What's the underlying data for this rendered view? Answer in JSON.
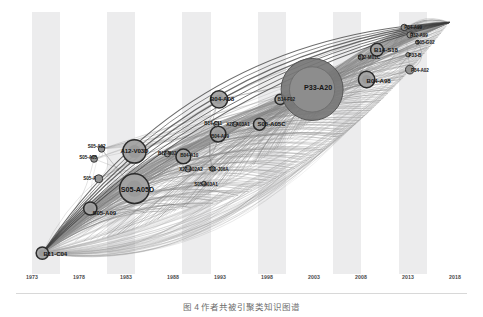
{
  "figure": {
    "caption": "图 4    作者共被引聚类知识图谱",
    "background_color": "#ffffff",
    "band_color": "#ececed",
    "node_fill": "#9b9b9b",
    "node_stroke": "#2b2b2b",
    "edge_color": "#8c8c8c"
  },
  "chart_data": {
    "type": "scatter",
    "title": "",
    "xlabel": "",
    "ylabel": "",
    "grid": false,
    "legend": "none",
    "xlim": [
      1973,
      2018
    ],
    "ylim": [
      0,
      100
    ],
    "tick_labels": [
      "1973",
      "1978",
      "1983",
      "1988",
      "1993",
      "1998",
      "2003",
      "2008",
      "2013",
      "2018"
    ],
    "tick_values": [
      1973,
      1978,
      1983,
      1988,
      1993,
      1998,
      2003,
      2008,
      2013,
      2018
    ],
    "bands": [
      {
        "from": 1973,
        "to": 1976
      },
      {
        "from": 1981,
        "to": 1984
      },
      {
        "from": 1989,
        "to": 1992
      },
      {
        "from": 1997,
        "to": 2000
      },
      {
        "from": 2005,
        "to": 2008
      },
      {
        "from": 2012,
        "to": 2015
      }
    ],
    "nodes": [
      {
        "id": "B11-C04",
        "label": "B11-C04",
        "x": 1974.1,
        "y": 6,
        "r": 6.2,
        "label_dx": 13,
        "label_dy": 0,
        "size": "mid"
      },
      {
        "id": "S05-A09",
        "label": "S05-A09",
        "x": 1979.2,
        "y": 24,
        "r": 6.6,
        "label_dx": 14,
        "label_dy": 4,
        "size": "mid"
      },
      {
        "id": "S05-A",
        "label": "S05-A",
        "x": 1980.1,
        "y": 36,
        "r": 4.0,
        "label_dx": -9,
        "label_dy": -1,
        "size": "sm"
      },
      {
        "id": "S05-A05",
        "label": "S05-A05",
        "x": 1979.6,
        "y": 44,
        "r": 3.4,
        "label_dx": -6,
        "label_dy": -2,
        "size": "sm"
      },
      {
        "id": "S05-A02",
        "label": "S05-A02",
        "x": 1980.4,
        "y": 48,
        "r": 3.2,
        "label_dx": -5,
        "label_dy": -3,
        "size": "sm"
      },
      {
        "id": "S05-A05D",
        "label": "S05-A05D",
        "x": 1983.9,
        "y": 32,
        "r": 14.8,
        "label_dx": 3,
        "label_dy": 0,
        "size": "big"
      },
      {
        "id": "A12-V03D",
        "label": "A12-V03D",
        "x": 1983.9,
        "y": 47,
        "r": 11.6,
        "label_dx": 0,
        "label_dy": -1,
        "size": "mid"
      },
      {
        "id": "B12-M02",
        "label": "B12-M02",
        "x": 1987.4,
        "y": 46,
        "r": 3.0,
        "label_dx": 0,
        "label_dy": -1,
        "size": "sm"
      },
      {
        "id": "B04-A10",
        "label": "B04-A10",
        "x": 1989.1,
        "y": 45,
        "r": 7.4,
        "label_dx": 6,
        "label_dy": -1,
        "size": "sm"
      },
      {
        "id": "X27-A02A2",
        "label": "X27-A02A2",
        "x": 1989.6,
        "y": 40,
        "r": 3.2,
        "label_dx": 3,
        "label_dy": 0,
        "size": "sm"
      },
      {
        "id": "T01-J06A",
        "label": "T01-J06A",
        "x": 1992.2,
        "y": 40,
        "r": 2.6,
        "label_dx": 6,
        "label_dy": 0,
        "size": "sm"
      },
      {
        "id": "S05-A03A1",
        "label": "S05-A03A1",
        "x": 1991.3,
        "y": 34,
        "r": 2.4,
        "label_dx": 2,
        "label_dy": 0,
        "size": "sm"
      },
      {
        "id": "B04-A09",
        "label": "B04-A09",
        "x": 1992.8,
        "y": 54,
        "r": 7.8,
        "label_dx": 2,
        "label_dy": 2,
        "size": "sm"
      },
      {
        "id": "B14-C11",
        "label": "B14-C11",
        "x": 1992.6,
        "y": 58,
        "r": 2.6,
        "label_dx": -3,
        "label_dy": -1,
        "size": "sm"
      },
      {
        "id": "X27-A03A1",
        "label": "X27-A03A1",
        "x": 1994.6,
        "y": 58,
        "r": 2.4,
        "label_dx": 3,
        "label_dy": 0,
        "size": "sm"
      },
      {
        "id": "B04-A08",
        "label": "B04-A08",
        "x": 1992.9,
        "y": 68,
        "r": 8.6,
        "label_dx": 3,
        "label_dy": -1,
        "size": "mid"
      },
      {
        "id": "S05-A05C",
        "label": "S05-A05C",
        "x": 1997.2,
        "y": 58,
        "r": 6.0,
        "label_dx": 12,
        "label_dy": -1,
        "size": "mid"
      },
      {
        "id": "B14-F02",
        "label": "B14-F02",
        "x": 1999.4,
        "y": 68,
        "r": 5.2,
        "label_dx": 6,
        "label_dy": 0,
        "size": "sm"
      },
      {
        "id": "P33-A20",
        "label": "P33-A20",
        "x": 2002.8,
        "y": 72,
        "r": 31.0,
        "label_dx": 6,
        "label_dy": -2,
        "size": "big"
      },
      {
        "id": "B04-A98",
        "label": "B04-A98",
        "x": 2008.6,
        "y": 76,
        "r": 8.2,
        "label_dx": 12,
        "label_dy": 0,
        "size": "mid"
      },
      {
        "id": "B12-M01C",
        "label": "B12-M01C",
        "x": 2008.0,
        "y": 85,
        "r": 2.8,
        "label_dx": 8,
        "label_dy": 0,
        "size": "sm"
      },
      {
        "id": "B14-S18",
        "label": "B14-S18",
        "x": 2009.7,
        "y": 88,
        "r": 6.4,
        "label_dx": 9,
        "label_dy": -1,
        "size": "mid"
      },
      {
        "id": "P34-A02",
        "label": "P34-A02",
        "x": 2013.2,
        "y": 80,
        "r": 4.4,
        "label_dx": 10,
        "label_dy": 0,
        "size": "sm"
      },
      {
        "id": "P33-B",
        "label": "P33-B",
        "x": 2013.0,
        "y": 86,
        "r": 2.2,
        "label_dx": 7,
        "label_dy": 0,
        "size": "sm"
      },
      {
        "id": "S05-G02",
        "label": "S05-G02",
        "x": 2014.0,
        "y": 91,
        "r": 2.0,
        "label_dx": 8,
        "label_dy": 0,
        "size": "sm"
      },
      {
        "id": "P32-A99",
        "label": "P32-A99",
        "x": 2013.2,
        "y": 94,
        "r": 3.0,
        "label_dx": 9,
        "label_dy": 0,
        "size": "sm"
      },
      {
        "id": "P34-A99",
        "label": "P34-A99",
        "x": 2012.6,
        "y": 97,
        "r": 3.2,
        "label_dx": 9,
        "label_dy": 0,
        "size": "sm"
      }
    ],
    "edge_hub_left": {
      "x": 1974.1,
      "y": 6
    },
    "edge_hub_right": {
      "x": 2017.4,
      "y": 99
    }
  }
}
